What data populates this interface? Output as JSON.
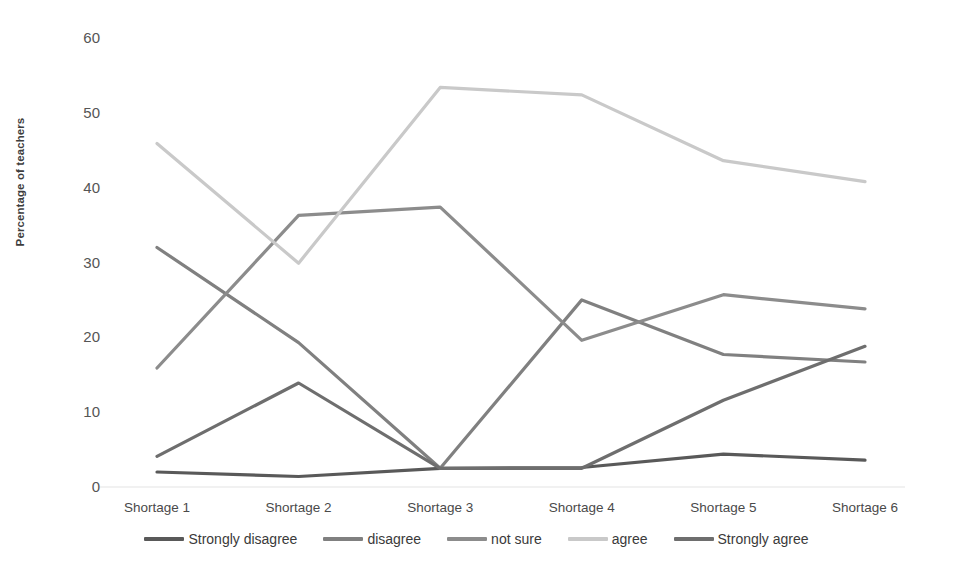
{
  "chart_data": {
    "type": "line",
    "title": "",
    "xlabel": "",
    "ylabel": "Percentage of teachers",
    "categories": [
      "Shortage 1",
      "Shortage 2",
      "Shortage 3",
      "Shortage 4",
      "Shortage 5",
      "Shortage 6"
    ],
    "ylim": [
      0,
      60
    ],
    "yticks": [
      0,
      10,
      20,
      30,
      40,
      50,
      60
    ],
    "grid": false,
    "legend_position": "bottom",
    "series": [
      {
        "name": "Strongly disagree",
        "color": "#595959",
        "values": [
          2.0,
          1.4,
          2.5,
          2.6,
          4.4,
          3.6
        ]
      },
      {
        "name": "disagree",
        "color": "#808080",
        "values": [
          32.0,
          19.3,
          2.5,
          25.0,
          17.7,
          16.7
        ]
      },
      {
        "name": "not sure",
        "color": "#8c8c8c",
        "values": [
          15.9,
          36.3,
          37.4,
          19.6,
          25.7,
          23.8
        ]
      },
      {
        "name": "agree",
        "color": "#c9c9c9",
        "values": [
          45.9,
          29.9,
          53.4,
          52.4,
          43.6,
          40.8
        ]
      },
      {
        "name": "Strongly agree",
        "color": "#6e6e6e",
        "values": [
          4.1,
          13.9,
          2.5,
          2.5,
          11.6,
          18.8
        ]
      }
    ]
  },
  "axis": {
    "y_title": "Percentage of teachers",
    "y_tick_labels": [
      "60",
      "50",
      "40",
      "30",
      "20",
      "10",
      "0"
    ],
    "x_tick_labels": [
      "Shortage 1",
      "Shortage 2",
      "Shortage 3",
      "Shortage 4",
      "Shortage 5",
      "Shortage 6"
    ]
  },
  "legend": {
    "items": [
      {
        "label": "Strongly disagree",
        "color": "#595959"
      },
      {
        "label": "disagree",
        "color": "#808080"
      },
      {
        "label": "not sure",
        "color": "#8c8c8c"
      },
      {
        "label": "agree",
        "color": "#c9c9c9"
      },
      {
        "label": "Strongly agree",
        "color": "#6e6e6e"
      }
    ]
  }
}
